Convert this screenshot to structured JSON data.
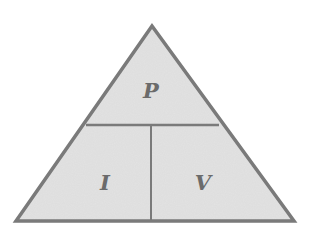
{
  "diagram": {
    "type": "formula-triangle",
    "colors": {
      "fill": "#e3e3e3",
      "stroke": "#7a7a7a",
      "label": "#6b6b6b",
      "background": "#ffffff"
    },
    "sections": {
      "top": {
        "label": "P"
      },
      "bottom_left": {
        "label": "I"
      },
      "bottom_right": {
        "label": "V"
      }
    }
  }
}
